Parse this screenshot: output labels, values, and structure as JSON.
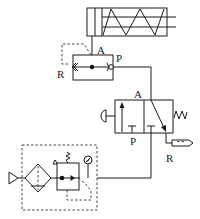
{
  "diagram": {
    "type": "pneumatic-circuit",
    "colors": {
      "line": "#1a1a1a",
      "background": "#ffffff"
    },
    "components": {
      "cylinder": {
        "name": "single-acting spring-return cylinder"
      },
      "quick_exhaust_valve": {
        "name": "quick exhaust valve",
        "ports": {
          "A": "A",
          "P": "P",
          "R": "R"
        }
      },
      "directional_valve": {
        "name": "3/2 push-button spring-return valve",
        "ports": {
          "A": "A",
          "P": "P",
          "R": "R"
        }
      },
      "silencer": {
        "name": "silencer"
      },
      "frl_unit": {
        "name": "air service unit",
        "parts": [
          "air inlet",
          "filter with drain",
          "pressure regulator",
          "pressure gauge"
        ]
      }
    },
    "labels": {
      "qev_A": "A",
      "qev_P": "P",
      "qev_R": "R",
      "dcv_A": "A",
      "dcv_P": "P",
      "dcv_R": "R"
    }
  }
}
